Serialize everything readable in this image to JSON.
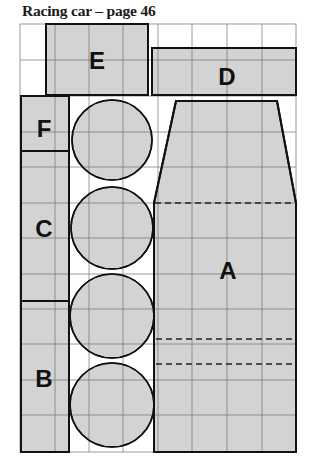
{
  "title": "Racing car – page 46",
  "colors": {
    "piece_fill": "#d3d3d3",
    "outline": "#111111",
    "grid": "#7a7a7a",
    "background": "#ffffff"
  },
  "grid": {
    "columns": 8,
    "rows": 12,
    "x": [
      20,
      55,
      89,
      123,
      158,
      192,
      227,
      262,
      296
    ],
    "y": [
      24,
      60,
      96,
      132,
      167,
      203,
      238,
      274,
      309,
      344,
      380,
      415,
      452
    ]
  },
  "pieces": {
    "A": {
      "label": "A",
      "shape": "trapezoid-top with rectangle body",
      "dashed_fold_lines": 3
    },
    "B": {
      "label": "B",
      "shape": "rectangle"
    },
    "C": {
      "label": "C",
      "shape": "rectangle"
    },
    "D": {
      "label": "D",
      "shape": "rectangle"
    },
    "E": {
      "label": "E",
      "shape": "rectangle"
    },
    "F": {
      "label": "F",
      "shape": "rectangle"
    },
    "wheels": {
      "count": 4,
      "shape": "circle"
    }
  }
}
